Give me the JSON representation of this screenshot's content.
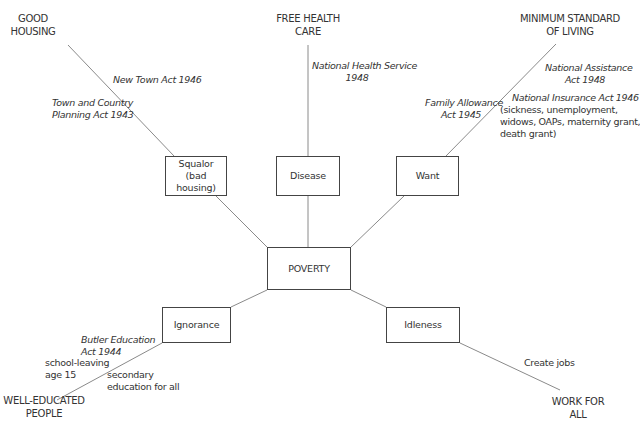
{
  "diagram": {
    "center": {
      "label": "POVERTY"
    },
    "evils": [
      {
        "id": "squalor",
        "lines": [
          "Squalor",
          "(bad housing)"
        ]
      },
      {
        "id": "disease",
        "lines": [
          "Disease"
        ]
      },
      {
        "id": "want",
        "lines": [
          "Want"
        ]
      },
      {
        "id": "ignorance",
        "lines": [
          "Ignorance"
        ]
      },
      {
        "id": "idleness",
        "lines": [
          "Idleness"
        ]
      }
    ],
    "goals": {
      "good_housing": [
        "GOOD",
        "HOUSING"
      ],
      "free_health_care": [
        "FREE HEALTH",
        "CARE"
      ],
      "minimum_standard": [
        "MINIMUM STANDARD",
        "OF LIVING"
      ],
      "well_educated": [
        "WELL-EDUCATED",
        "PEOPLE"
      ],
      "work_for_all": [
        "WORK FOR",
        "ALL"
      ]
    },
    "acts": {
      "new_town": [
        "New Town Act 1946"
      ],
      "town_country": [
        "Town and Country",
        "Planning Act 1943"
      ],
      "nhs": [
        "National Health Service",
        "1948"
      ],
      "national_assistance": [
        "National Assistance",
        "Act 1948"
      ],
      "family_allowance": [
        "Family Allowance",
        "Act 1945"
      ],
      "national_insurance": [
        "National Insurance Act 1946"
      ],
      "national_insurance_detail": [
        "(sickness, unemployment,",
        "widows, OAPs, maternity grant,",
        "death grant)"
      ],
      "butler": [
        "Butler Education",
        "Act 1944"
      ],
      "school_leaving": [
        "school-leaving",
        "age 15"
      ],
      "secondary": [
        "secondary",
        "education for all"
      ],
      "create_jobs": [
        "Create jobs"
      ]
    },
    "colors": {
      "line": "#8a8a8a",
      "box_border": "#444444",
      "text": "#333333"
    }
  }
}
